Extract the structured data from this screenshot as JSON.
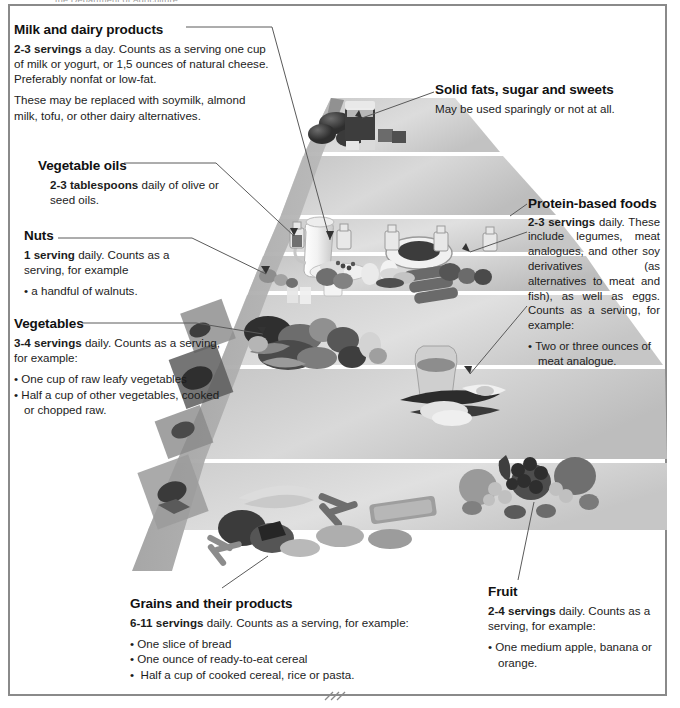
{
  "page": {
    "cut_header": "the Department of Agriculture..."
  },
  "pyramid": {
    "tiers": [
      {
        "id": "apex",
        "name": "Solid fats, sugar and sweets",
        "foods": "honey jar, sugar cubes, chocolate, butter"
      },
      {
        "id": "dairy",
        "name": "Milk and dairy products",
        "foods": "milk pitcher, cheese plate, yogurt jar, eggs, tofu blocks"
      },
      {
        "id": "oils",
        "name": "Vegetable oils",
        "foods": "small oil bottles"
      },
      {
        "id": "nuts",
        "name": "Nuts",
        "foods": "walnuts, almonds, cashews"
      },
      {
        "id": "veg-protein",
        "name": "Vegetables and protein-based foods",
        "foods": "mixed vegetables, sack of grains, beans and legumes"
      },
      {
        "id": "grains-fruit",
        "name": "Grains and fruit",
        "foods": "bread, cereal, pasta, rice, apples, grapes, pears"
      }
    ]
  },
  "callouts": {
    "dairy": {
      "heading": "Milk and dairy products",
      "lead": "2-3 servings",
      "body": " a day. Counts as a serving one cup of milk or yogurt, or 1,5 ounces  of natural cheese. Preferably nonfat or low-fat.",
      "body2": "These may be replaced with soymilk,  almond milk, tofu, or other dairy alternatives."
    },
    "oils": {
      "heading": "Vegetable oils",
      "lead": "2-3 tablespoons",
      "body": " daily of olive or seed oils."
    },
    "nuts": {
      "heading": "Nuts",
      "lead": "1 serving",
      "body": " daily. Counts as a serving, for example",
      "items": [
        "a handful of walnuts."
      ]
    },
    "vegetables": {
      "heading": "Vegetables",
      "lead": "3-4 servings",
      "body": " daily. Counts as a serving, for example:",
      "items": [
        "One cup of raw leafy vegetables",
        "Half a cup of other vegetables, cooked or chopped raw."
      ]
    },
    "sweets": {
      "heading": "Solid fats, sugar and sweets",
      "body": "May be used sparingly or not at all."
    },
    "protein": {
      "heading": "Protein-based foods",
      "lead": "2-3  servings",
      "body": "  daily. These include legumes, meat analogues, and other soy derivatives (as alternatives to meat and fish), as well as eggs. Counts as a serving, for example:",
      "items": [
        "Two or three ounces of meat analogue."
      ]
    },
    "grains": {
      "heading": "Grains and their products",
      "lead": "6-11 servings",
      "body": " daily. Counts as a serving, for example:",
      "items": [
        "One slice of bread",
        "One ounce of ready-to-eat cereal",
        " Half a cup of cooked cereal, rice or pasta."
      ]
    },
    "fruit": {
      "heading": "Fruit",
      "lead": "2-4 servings",
      "body": " daily. Counts as a serving, for example:",
      "items": [
        "One medium apple, banana or orange."
      ]
    }
  },
  "colors": {
    "frame": "#8a8a8a",
    "tier_light": "#e3e3e3",
    "tier_mid": "#cfcfcf",
    "tier_dark": "#b9b9b9",
    "side_face": "#a9a9a9",
    "leader_line": "#5a5a5a",
    "text": "#1c1c1c"
  }
}
